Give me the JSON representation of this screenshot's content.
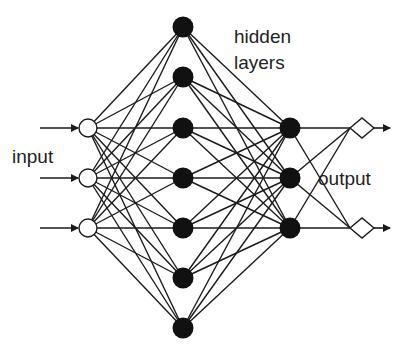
{
  "labels": {
    "input": "input",
    "hidden_line1": "hidden",
    "hidden_line2": "layers",
    "output": "output"
  },
  "colors": {
    "stroke": "#1a1a1a",
    "filled_node": "#111111",
    "open_node": "#ffffff",
    "text": "#222222"
  },
  "layers": [
    {
      "name": "input",
      "shape": "open-circle",
      "x": 88,
      "ys": [
        128,
        178,
        228
      ]
    },
    {
      "name": "hidden-1",
      "shape": "filled-circle",
      "x": 183,
      "ys": [
        27,
        77,
        128,
        178,
        228,
        278,
        328
      ]
    },
    {
      "name": "hidden-2",
      "shape": "filled-circle",
      "x": 290,
      "ys": [
        128,
        178,
        228
      ]
    },
    {
      "name": "output",
      "shape": "diamond",
      "x": 362,
      "ys": [
        128,
        228
      ]
    }
  ]
}
